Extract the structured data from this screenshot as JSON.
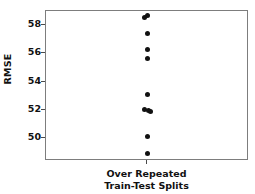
{
  "chart_data": {
    "type": "scatter",
    "title": "",
    "xlabel": "Over Repeated Train-Test Splits",
    "xlabel_lines": [
      "Over Repeated",
      "Train-Test Splits"
    ],
    "ylabel": "RMSE",
    "x_categories": [
      "Over Repeated Train-Test Splits"
    ],
    "xtick_labels": [],
    "ytick_labels": [
      "50",
      "52",
      "54",
      "56",
      "58"
    ],
    "yticks": [
      50,
      52,
      54,
      56,
      58
    ],
    "ylim": [
      48.4,
      59.0
    ],
    "grid": false,
    "legend": null,
    "marker": "filled-circle",
    "marker_color": "#111111",
    "frame_color": "#7d7d7d",
    "background_color": "#ffffff",
    "n_points": 11,
    "values": [
      58.65,
      58.55,
      57.4,
      56.25,
      55.65,
      53.1,
      52.05,
      51.95,
      51.9,
      50.15,
      48.9
    ],
    "points": [
      {
        "x": 0,
        "y": 58.65
      },
      {
        "x": 0,
        "y": 58.55
      },
      {
        "x": 0,
        "y": 57.4
      },
      {
        "x": 0,
        "y": 56.25
      },
      {
        "x": 0,
        "y": 55.65
      },
      {
        "x": 0,
        "y": 53.1
      },
      {
        "x": 0,
        "y": 52.05
      },
      {
        "x": 0,
        "y": 51.95
      },
      {
        "x": 0,
        "y": 51.9
      },
      {
        "x": 0,
        "y": 50.15
      },
      {
        "x": 0,
        "y": 48.9
      }
    ]
  }
}
